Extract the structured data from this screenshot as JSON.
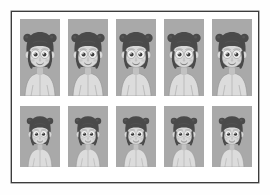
{
  "page": {
    "background_color": "#fefefe",
    "sheet_color": "#ffffff",
    "border_color": "#3c3c3c",
    "cell_background_color": "#a9a9a9"
  },
  "grid": {
    "rows": 2,
    "columns": 5,
    "total_cells": 10,
    "cell_label": "character-portrait"
  },
  "character": {
    "name": "cartoon-girl-with-buns",
    "hair_color": "#4a4a4a",
    "hair_highlight_color": "#5e5e5e",
    "skin_color": "#d8d8d8",
    "skin_shadow_color": "#c2c2c2",
    "eye_white_color": "#f2f2f2",
    "pupil_color": "#3b3b3b",
    "shirt_color": "#dcdcdc",
    "outline_color": "#8a8a8a",
    "features": [
      "two-side-buns",
      "straight-bangs",
      "large-round-eyes",
      "small-ears",
      "light-shirt"
    ]
  },
  "cells": [
    {
      "index": 1,
      "row": 1,
      "column": 1,
      "label": "portrait-1"
    },
    {
      "index": 2,
      "row": 1,
      "column": 2,
      "label": "portrait-2"
    },
    {
      "index": 3,
      "row": 1,
      "column": 3,
      "label": "portrait-3"
    },
    {
      "index": 4,
      "row": 1,
      "column": 4,
      "label": "portrait-4"
    },
    {
      "index": 5,
      "row": 1,
      "column": 5,
      "label": "portrait-5"
    },
    {
      "index": 6,
      "row": 2,
      "column": 1,
      "label": "portrait-6"
    },
    {
      "index": 7,
      "row": 2,
      "column": 2,
      "label": "portrait-7"
    },
    {
      "index": 8,
      "row": 2,
      "column": 3,
      "label": "portrait-8"
    },
    {
      "index": 9,
      "row": 2,
      "column": 4,
      "label": "portrait-9"
    },
    {
      "index": 10,
      "row": 2,
      "column": 5,
      "label": "portrait-10"
    }
  ]
}
